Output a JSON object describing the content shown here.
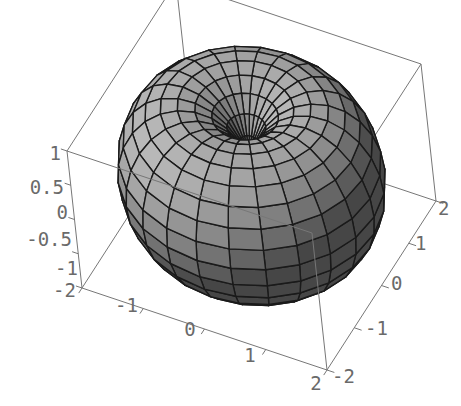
{
  "chart_data": {
    "type": "surface3d",
    "title": "",
    "surface": {
      "shape": "torus",
      "major_radius": 1,
      "minor_radius": 1,
      "u_divisions": 24,
      "v_divisions": 24,
      "fill_color": "#9a9a9a",
      "mesh_color": "#1a1a1a"
    },
    "axes": {
      "x": {
        "label": "",
        "range": [
          -2,
          2
        ],
        "ticks": [
          "-2",
          "-1",
          "0",
          "1",
          "2"
        ]
      },
      "y": {
        "label": "",
        "range": [
          -2,
          2
        ],
        "ticks": [
          "-2",
          "-1",
          "0",
          "1",
          "2"
        ]
      },
      "z": {
        "label": "",
        "range": [
          -1,
          1
        ],
        "ticks": [
          "-1",
          "-0.5",
          "0",
          "0.5",
          "1"
        ]
      }
    },
    "box": true,
    "grid": false,
    "legend": null
  },
  "labels": {
    "z_ticks": [
      "1",
      "0.5",
      "0",
      "-0.5",
      "-1"
    ],
    "x_ticks": [
      "-2",
      "-1",
      "0",
      "1",
      "2"
    ],
    "y_ticks": [
      "-2",
      "-1",
      "0",
      "1",
      "2"
    ]
  },
  "colors": {
    "box": "#777777",
    "tick_text": "#6a6a6a",
    "surface_light": "#b4b4b4",
    "surface_dark": "#4a4a4a",
    "mesh": "#1a1a1a"
  }
}
